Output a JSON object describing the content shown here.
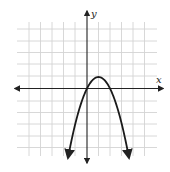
{
  "chart_data": {
    "type": "line",
    "title": "",
    "xlabel": "x",
    "ylabel": "y",
    "grid": true,
    "xlim": [
      -5,
      5
    ],
    "ylim": [
      -5,
      5
    ],
    "function": "y = -(x - 1)^2 + 1",
    "vertex": [
      1,
      1
    ],
    "x_intercepts": [
      0,
      2
    ],
    "series": [
      {
        "name": "parabola",
        "x": [
          -1.65,
          -1,
          0,
          1,
          2,
          3,
          3.65
        ],
        "y": [
          -6,
          -3,
          0,
          1,
          0,
          -3,
          -6
        ]
      }
    ]
  },
  "labels": {
    "x_axis": "x",
    "y_axis": "y"
  },
  "colors": {
    "grid": "#d4d4d4",
    "axis": "#222222",
    "curve": "#1a1a1a"
  }
}
